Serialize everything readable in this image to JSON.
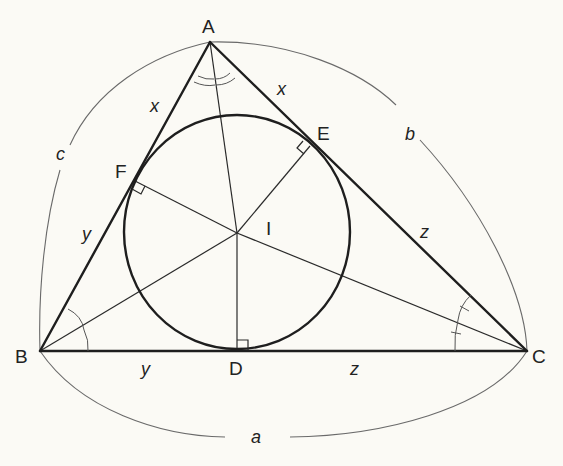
{
  "diagram": {
    "vertices": {
      "A": "A",
      "B": "B",
      "C": "C"
    },
    "tangent_points": {
      "D": "D",
      "E": "E",
      "F": "F"
    },
    "incenter": "I",
    "side_labels": {
      "a": "a",
      "b": "b",
      "c": "c"
    },
    "tangent_lengths": {
      "AF": "x",
      "AE": "x",
      "BF": "y",
      "BD": "y",
      "CD": "z",
      "CE": "z"
    },
    "colors": {
      "line": "#1e1e1e",
      "arc": "#6a6a6a",
      "background": "#fbfaf5"
    }
  }
}
